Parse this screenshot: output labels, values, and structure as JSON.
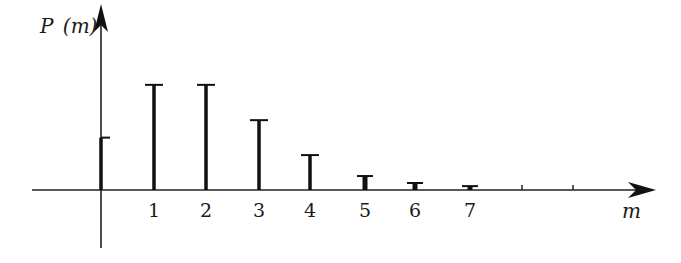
{
  "chart_data": {
    "type": "bar",
    "style": "stem",
    "title": "",
    "xlabel": "m",
    "ylabel": "P (m)",
    "categories": [
      "0",
      "1",
      "2",
      "3",
      "4",
      "5",
      "6",
      "7",
      "8",
      "9"
    ],
    "tick_labels": [
      "1",
      "2",
      "3",
      "4",
      "5",
      "6",
      "7"
    ],
    "values": [
      0.135,
      0.271,
      0.271,
      0.18,
      0.09,
      0.036,
      0.018,
      0.01,
      0,
      0
    ],
    "unlabeled_ticks": [
      8,
      9
    ],
    "xlim": [
      -1.3,
      10.5
    ],
    "ylim": [
      -0.15,
      0.47
    ],
    "grid": false,
    "legend": null,
    "colors": {
      "stem": "#111111",
      "axis": "#222222",
      "background": "#ffffff"
    }
  },
  "labels": {
    "ylabel": "P (m)",
    "ylabel_p": "P",
    "ylabel_paren": "(m)",
    "xlabel": "m"
  }
}
